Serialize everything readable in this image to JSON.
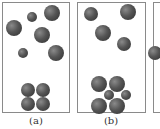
{
  "figure": {
    "panels": [
      {
        "label": "(a)",
        "box": {
          "x": 2,
          "y": 2,
          "w": 68,
          "h": 111
        },
        "spheres": [
          {
            "cx": 52,
            "cy": 13,
            "r": 8,
            "kind": "large"
          },
          {
            "cx": 32,
            "cy": 17,
            "r": 5,
            "kind": "small"
          },
          {
            "cx": 14,
            "cy": 28,
            "r": 8,
            "kind": "large"
          },
          {
            "cx": 42,
            "cy": 35,
            "r": 8,
            "kind": "large"
          },
          {
            "cx": 23,
            "cy": 53,
            "r": 5,
            "kind": "small"
          },
          {
            "cx": 56,
            "cy": 53,
            "r": 8,
            "kind": "large"
          },
          {
            "cx": 28,
            "cy": 90,
            "r": 7,
            "kind": "large"
          },
          {
            "cx": 43,
            "cy": 90,
            "r": 7,
            "kind": "large"
          },
          {
            "cx": 28,
            "cy": 104,
            "r": 7,
            "kind": "large"
          },
          {
            "cx": 43,
            "cy": 104,
            "r": 7,
            "kind": "large"
          }
        ]
      },
      {
        "label": "(b)",
        "box": {
          "x": 77,
          "y": 2,
          "w": 69,
          "h": 111
        },
        "spheres": [
          {
            "cx": 91,
            "cy": 14,
            "r": 7,
            "kind": "medium"
          },
          {
            "cx": 128,
            "cy": 12,
            "r": 8,
            "kind": "large"
          },
          {
            "cx": 103,
            "cy": 33,
            "r": 8,
            "kind": "large"
          },
          {
            "cx": 124,
            "cy": 44,
            "r": 7,
            "kind": "medium"
          },
          {
            "cx": 99,
            "cy": 84,
            "r": 8,
            "kind": "large"
          },
          {
            "cx": 117,
            "cy": 84,
            "r": 8,
            "kind": "large"
          },
          {
            "cx": 109,
            "cy": 95,
            "r": 5,
            "kind": "small"
          },
          {
            "cx": 126,
            "cy": 95,
            "r": 5,
            "kind": "small"
          },
          {
            "cx": 99,
            "cy": 106,
            "r": 8,
            "kind": "large"
          },
          {
            "cx": 117,
            "cy": 106,
            "r": 8,
            "kind": "large"
          }
        ]
      },
      {
        "label": "",
        "box": {
          "x": 153,
          "y": 2,
          "w": 20,
          "h": 111
        },
        "spheres": [
          {
            "cx": 155,
            "cy": 53,
            "r": 7,
            "kind": "large"
          }
        ]
      }
    ],
    "captions": [
      {
        "text": "(a)",
        "x": 16,
        "y": 116
      },
      {
        "text": "(b)",
        "x": 91,
        "y": 116
      }
    ],
    "colors": {
      "border": "#8a8a8a",
      "sphere_light": "#8a8a8a",
      "sphere_dark": "#2e2e2e",
      "background": "#ffffff"
    }
  }
}
